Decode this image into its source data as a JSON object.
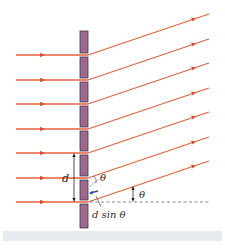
{
  "figure": {
    "type": "diffraction-grating-diagram",
    "labels": {
      "spacing": "d",
      "angle_small": "θ",
      "angle_outgoing": "θ",
      "path_difference": "d sin θ"
    },
    "colors": {
      "ray": "#e0623f",
      "grating": "#9a6a8e",
      "grating_edge": "#4a3346",
      "dashed_line": "#666666",
      "caption_bar": "#e6ebef",
      "path_arrow": "#2b4fa8"
    },
    "incoming_ray_count": 7,
    "outgoing_ray_count": 7
  }
}
